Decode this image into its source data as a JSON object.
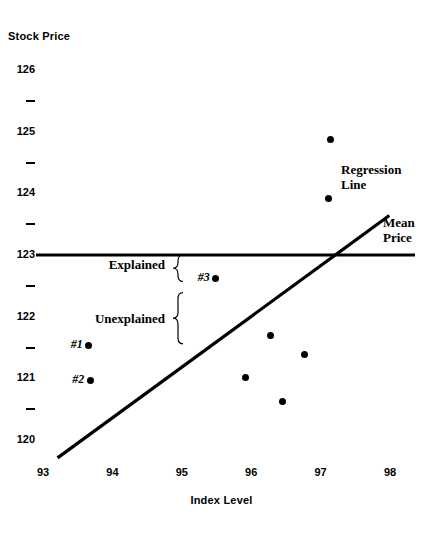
{
  "chart_data": {
    "type": "scatter",
    "title": "",
    "xlabel": "Index Level",
    "ylabel": "Stock Price",
    "xlim": [
      93,
      98
    ],
    "ylim": [
      120,
      126
    ],
    "grid": false,
    "legend": "none",
    "x_ticks": [
      "93",
      "94",
      "95",
      "96",
      "97",
      "98"
    ],
    "x_tick_values": [
      93,
      94,
      95,
      96,
      97,
      98
    ],
    "y_ticks": [
      "120",
      "121",
      "122",
      "123",
      "124",
      "125",
      "126"
    ],
    "y_tick_values": [
      120,
      121,
      122,
      123,
      124,
      125,
      126
    ],
    "y_minor_ticks": [
      120.5,
      121.5,
      122.5,
      123.5,
      124.5,
      125.5
    ],
    "points": [
      {
        "label": "#1",
        "x": 93.66,
        "y": 121.54
      },
      {
        "label": "#2",
        "x": 93.68,
        "y": 120.97
      },
      {
        "label": "#3",
        "x": 95.49,
        "y": 122.62
      },
      {
        "label": "",
        "x": 96.28,
        "y": 121.7
      },
      {
        "label": "",
        "x": 96.77,
        "y": 121.38
      },
      {
        "label": "",
        "x": 95.92,
        "y": 121.01
      },
      {
        "label": "",
        "x": 96.45,
        "y": 120.62
      },
      {
        "label": "",
        "x": 97.14,
        "y": 124.88
      },
      {
        "label": "",
        "x": 97.11,
        "y": 123.91
      }
    ],
    "mean_price": {
      "label": "Mean Price",
      "value": 123,
      "x_start": 36,
      "x_end": 415
    },
    "regression": {
      "label": "Regression Line",
      "x_start": 93.21,
      "y_start": 119.71,
      "x_end": 97.99,
      "y_end": 123.64
    },
    "annotations": [
      {
        "name": "explained",
        "label": "Explained",
        "y_top": 123.0,
        "y_bottom": 122.57
      },
      {
        "name": "unexplained",
        "label": "Unexplained",
        "y_top": 122.39,
        "y_bottom": 121.56
      }
    ]
  }
}
